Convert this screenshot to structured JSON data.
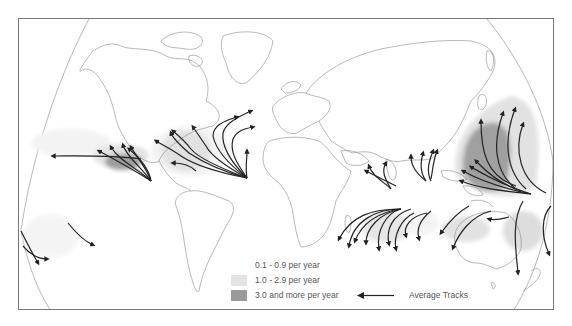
{
  "map": {
    "title": "Tropical cyclone frequency and average tracks",
    "colors": {
      "land_outline": "#8a8a8a",
      "track": "#222222",
      "frequency_low": "#f4f4f4",
      "frequency_mid": "#e0e0e0",
      "frequency_high": "#9a9a9a",
      "frame": "#777777"
    },
    "regions": [
      {
        "name": "North Atlantic",
        "frequency": "high"
      },
      {
        "name": "Eastern North Pacific",
        "frequency": "high"
      },
      {
        "name": "Western North Pacific",
        "frequency": "high"
      },
      {
        "name": "North Indian Ocean",
        "frequency": "low"
      },
      {
        "name": "South-West Indian Ocean",
        "frequency": "mid"
      },
      {
        "name": "Australian Region",
        "frequency": "mid"
      },
      {
        "name": "South Pacific",
        "frequency": "mid"
      }
    ]
  },
  "legend": {
    "items": [
      {
        "label": "0.1 - 0.9 per year",
        "color": "#f6f6f6"
      },
      {
        "label": "1.0 - 2.9 per year",
        "color": "#e3e3e3"
      },
      {
        "label": "3.0 and more per year",
        "color": "#9a9a9a"
      }
    ],
    "tracks_label": "Average Tracks",
    "tracks_icon": "left-arrow-icon"
  }
}
